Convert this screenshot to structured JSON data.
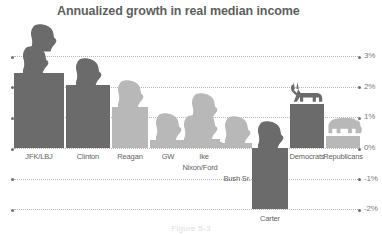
{
  "chart_data": {
    "type": "bar",
    "title": "Annualized growth in real median income",
    "xlabel": "",
    "ylabel": "",
    "ylim": [
      -2.3,
      3.3
    ],
    "yticks": [
      3,
      2,
      1,
      0,
      -1,
      -2
    ],
    "ytick_labels": [
      "3%",
      "2%",
      "1%",
      "0%",
      "-1%",
      "-2%"
    ],
    "grid": true,
    "legend": "none",
    "categories": [
      "JFK/LBJ",
      "Clinton",
      "Reagan",
      "GW",
      "Ike",
      "Nixon/Ford",
      "Bush Sr.",
      "Carter",
      "Democrats",
      "Republicans"
    ],
    "values": [
      2.45,
      2.05,
      1.35,
      0.25,
      0.3,
      0.2,
      0.15,
      -2.0,
      1.45,
      0.4
    ],
    "party": [
      "dem",
      "dem",
      "rep",
      "rep",
      "rep",
      "rep",
      "rep",
      "dem",
      "dem",
      "rep"
    ],
    "icons": [
      "head",
      "head",
      "head",
      "head",
      "head",
      "head",
      "head",
      "head",
      "donkey",
      "elephant"
    ],
    "icon_counts": [
      2,
      1,
      1,
      1,
      1,
      2,
      1,
      1,
      1,
      1
    ]
  },
  "axis": {
    "ticks": [
      {
        "label": "3%",
        "value": 3
      },
      {
        "label": "2%",
        "value": 2
      },
      {
        "label": "1%",
        "value": 1
      },
      {
        "label": "0%",
        "value": 0
      },
      {
        "label": "-1%",
        "value": -1
      },
      {
        "label": "-2%",
        "value": -2
      }
    ]
  },
  "bars": [
    {
      "label": "JFK/LBJ",
      "value": 2.45,
      "party": "dem"
    },
    {
      "label": "Clinton",
      "value": 2.05,
      "party": "dem"
    },
    {
      "label": "Reagan",
      "value": 1.35,
      "party": "rep"
    },
    {
      "label": "GW",
      "value": 0.25,
      "party": "rep"
    },
    {
      "label": "Ike",
      "value": 0.3,
      "party": "rep"
    },
    {
      "label": "Nixon/Ford",
      "value": 0.2,
      "party": "rep"
    },
    {
      "label": "Bush Sr.",
      "value": 0.15,
      "party": "rep"
    },
    {
      "label": "Carter",
      "value": -2.0,
      "party": "dem"
    },
    {
      "label": "Democrats",
      "value": 1.45,
      "party": "dem"
    },
    {
      "label": "Republicans",
      "value": 0.4,
      "party": "rep"
    }
  ],
  "caption": "Figure 5-3",
  "colors": {
    "democrat_bar": "#6b6b6b",
    "republican_bar": "#b8b8b8",
    "title": "#5f5f5f",
    "gridline": "#b9b9b9",
    "label": "#5f5f5f",
    "background": "#ffffff"
  }
}
